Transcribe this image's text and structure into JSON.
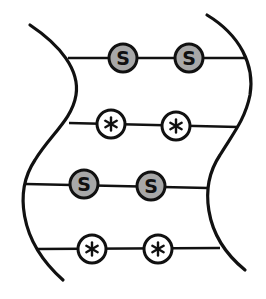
{
  "diagram": {
    "background": "#ffffff",
    "stroke_color": "#111111",
    "strands": [
      {
        "id": "left-strand",
        "path": "M30,25 C60,45 80,70 76,95 C72,120 50,135 35,160 C15,190 18,240 63,280"
      },
      {
        "id": "right-strand",
        "path": "M207,15 C240,35 255,65 250,95 C245,120 232,135 220,155 C200,185 202,235 245,270"
      }
    ],
    "rungs": [
      {
        "y1": 58,
        "y2": 58,
        "x1": 68,
        "x2": 247,
        "nodes": [
          {
            "cx": 123,
            "cy": 58,
            "type": "S",
            "label": "S",
            "fill": "#a8a8a8"
          },
          {
            "cx": 189,
            "cy": 58,
            "type": "S",
            "label": "S",
            "fill": "#a8a8a8"
          }
        ]
      },
      {
        "y1": 123,
        "y2": 127,
        "x1": 69,
        "x2": 238,
        "nodes": [
          {
            "cx": 111,
            "cy": 124,
            "type": "star",
            "label": "*",
            "fill": "#ffffff"
          },
          {
            "cx": 176,
            "cy": 126,
            "type": "star",
            "label": "*",
            "fill": "#ffffff"
          }
        ]
      },
      {
        "y1": 184,
        "y2": 188,
        "x1": 26,
        "x2": 208,
        "nodes": [
          {
            "cx": 84,
            "cy": 184,
            "type": "S",
            "label": "S",
            "fill": "#a8a8a8"
          },
          {
            "cx": 151,
            "cy": 186,
            "type": "S",
            "label": "S",
            "fill": "#a8a8a8"
          }
        ]
      },
      {
        "y1": 249,
        "y2": 248,
        "x1": 36,
        "x2": 220,
        "nodes": [
          {
            "cx": 92,
            "cy": 249,
            "type": "star",
            "label": "*",
            "fill": "#ffffff"
          },
          {
            "cx": 158,
            "cy": 249,
            "type": "star",
            "label": "*",
            "fill": "#ffffff"
          }
        ]
      }
    ],
    "node_radius": 14
  }
}
